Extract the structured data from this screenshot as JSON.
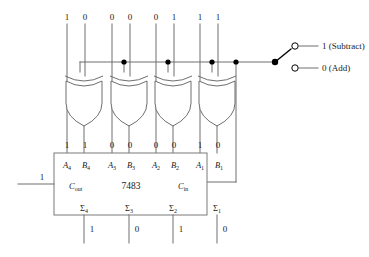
{
  "diagram": {
    "chip": {
      "name": "7483",
      "carry_out_label": "C",
      "carry_out_sub": "out",
      "carry_out_value": "1",
      "carry_in_label": "C",
      "carry_in_sub": "in"
    },
    "top_inputs": [
      {
        "a_value": "1",
        "b_value": "0"
      },
      {
        "a_value": "0",
        "b_value": "0"
      },
      {
        "a_value": "0",
        "b_value": "1"
      },
      {
        "a_value": "1",
        "b_value": "1"
      }
    ],
    "gate_outputs": [
      {
        "a_value": "1",
        "b_value": "1"
      },
      {
        "a_value": "0",
        "b_value": "0"
      },
      {
        "a_value": "0",
        "b_value": "0"
      },
      {
        "a_value": "1",
        "b_value": "0"
      }
    ],
    "input_pins": [
      {
        "letter": "A",
        "index": "4"
      },
      {
        "letter": "B",
        "index": "4"
      },
      {
        "letter": "A",
        "index": "3"
      },
      {
        "letter": "B",
        "index": "3"
      },
      {
        "letter": "A",
        "index": "2"
      },
      {
        "letter": "B",
        "index": "2"
      },
      {
        "letter": "A",
        "index": "1"
      },
      {
        "letter": "B",
        "index": "1"
      }
    ],
    "sum_pins": [
      {
        "symbol": "Σ",
        "index": "4",
        "value": "1"
      },
      {
        "symbol": "Σ",
        "index": "3",
        "value": "0"
      },
      {
        "symbol": "Σ",
        "index": "2",
        "value": "1"
      },
      {
        "symbol": "Σ",
        "index": "1",
        "value": "0"
      }
    ],
    "mode_switch": {
      "subtract_label": "1 (Subtract)",
      "add_label": "0 (Add)",
      "selected": "1 (Subtract)"
    },
    "colors": {
      "wire": "#6e6e6e",
      "box": "#7a7a7a",
      "node": "#000000",
      "text": "#1a1a1a",
      "background": "#ffffff"
    }
  }
}
